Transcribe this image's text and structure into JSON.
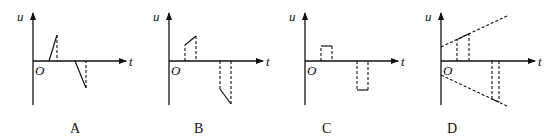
{
  "figure": {
    "axis_labels": {
      "y": "u",
      "x": "t",
      "origin": "O"
    },
    "panels": [
      {
        "id": "A",
        "caption": "A",
        "description": "Two triangular spikes: positive ramp up then drop, later negative ramp down then return"
      },
      {
        "id": "B",
        "caption": "B",
        "description": "Two trapezoidal pulses: positive pulse with rising top, later negative pulse with falling bottom"
      },
      {
        "id": "C",
        "caption": "C",
        "description": "Two rectangular pulses: short positive pulse, later negative pulse of larger magnitude"
      },
      {
        "id": "D",
        "caption": "D",
        "description": "Upper and lower dashed envelope lines diverging from axis; positive segment on upper line, negative segment on lower line"
      }
    ]
  }
}
